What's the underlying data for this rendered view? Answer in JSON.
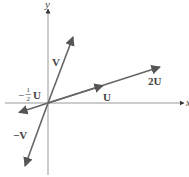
{
  "diagram": {
    "axes": {
      "x_label": "x",
      "y_label": "y"
    },
    "vectors": [
      {
        "name": "V",
        "label": "V",
        "from": [
          48,
          103
        ],
        "to": [
          73,
          37
        ]
      },
      {
        "name": "-V",
        "label": "−V",
        "from": [
          48,
          103
        ],
        "to": [
          25,
          167
        ]
      },
      {
        "name": "U",
        "label": "U",
        "from": [
          48,
          103
        ],
        "to": [
          103,
          85
        ]
      },
      {
        "name": "2U",
        "label": "2U",
        "from": [
          48,
          103
        ],
        "to": [
          160,
          67
        ]
      },
      {
        "name": "-1/2U",
        "label_prefix": "−",
        "label_num": "1",
        "label_den": "2",
        "label_suffix": "U",
        "from": [
          48,
          103
        ],
        "to": [
          20,
          112
        ]
      }
    ],
    "colors": {
      "axis": "#888888",
      "vector": "#555555",
      "text": "#444444"
    }
  }
}
